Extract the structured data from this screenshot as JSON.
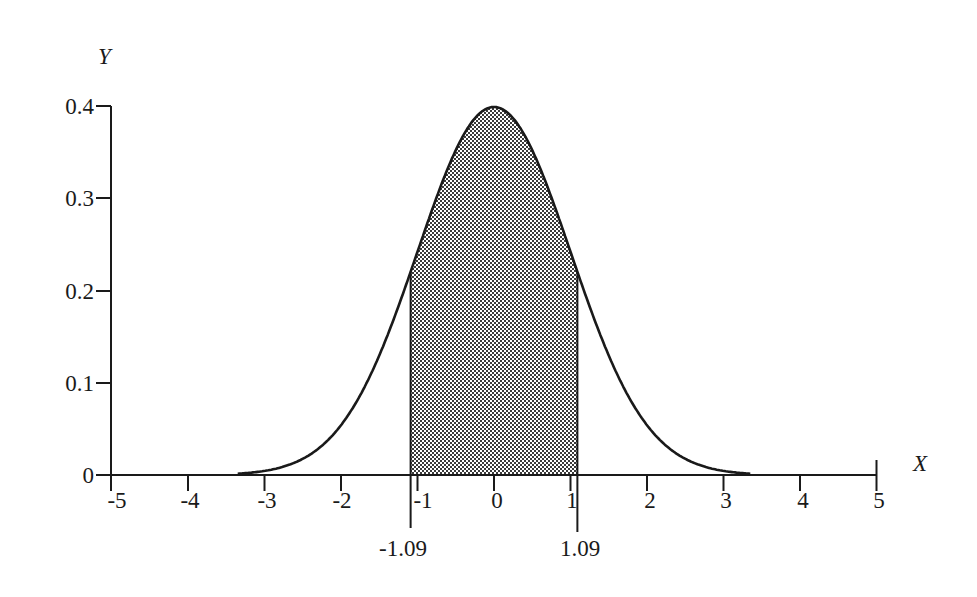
{
  "chart_data": {
    "type": "area",
    "title": "",
    "xlabel": "X",
    "ylabel": "Y",
    "xlim": [
      -5,
      5
    ],
    "ylim": [
      0,
      0.4
    ],
    "grid": false,
    "legend": null,
    "x_ticks": [
      "-5",
      "-4",
      "-3",
      "-2",
      "-1",
      "0",
      "1",
      "2",
      "3",
      "4",
      "5"
    ],
    "y_ticks": [
      "0",
      "0.1",
      "0.2",
      "0.3",
      "0.4"
    ],
    "series": [
      {
        "name": "N(0,1) density",
        "x": [
          -3.3,
          -3,
          -2.5,
          -2,
          -1.5,
          -1.09,
          -1,
          -0.5,
          0,
          0.5,
          1,
          1.09,
          1.5,
          2,
          2.5,
          3,
          3.3
        ],
        "y": [
          0.002,
          0.004,
          0.018,
          0.054,
          0.13,
          0.22,
          0.242,
          0.352,
          0.399,
          0.352,
          0.242,
          0.22,
          0.13,
          0.054,
          0.018,
          0.004,
          0.002
        ]
      }
    ],
    "shaded_region": {
      "from": -1.09,
      "to": 1.09,
      "fill": "checkered gray"
    },
    "annotations": [
      {
        "x": -1.09,
        "label": "-1.09"
      },
      {
        "x": 1.09,
        "label": "1.09"
      }
    ]
  },
  "labels": {
    "y_axis": "Y",
    "x_axis": "X",
    "y0": "0",
    "y1": "0.1",
    "y2": "0.2",
    "y3": "0.3",
    "y4": "0.4",
    "xm5": "-5",
    "xm4": "-4",
    "xm3": "-3",
    "xm2": "-2",
    "xm1": "-1",
    "x0": "0",
    "x1": "1",
    "x2": "2",
    "x3": "3",
    "x4": "4",
    "x5": "5",
    "left_bound": "-1.09",
    "right_bound": "1.09"
  },
  "colors": {
    "ink": "#1a1a1a",
    "shade_dark": "#3a3a3a",
    "shade_light": "#ffffff"
  }
}
